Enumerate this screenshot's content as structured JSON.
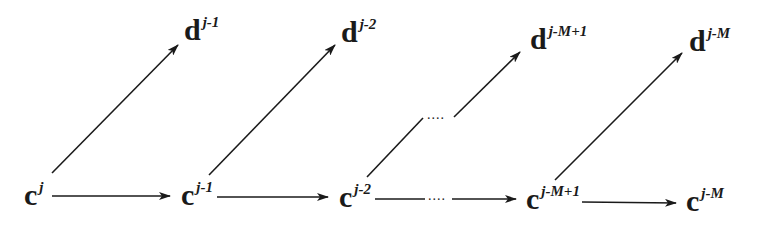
{
  "diagram": {
    "type": "wavelet-decomposition-tree",
    "c_nodes": [
      {
        "base": "c",
        "sup": "j"
      },
      {
        "base": "c",
        "sup": "j-1"
      },
      {
        "base": "c",
        "sup": "j-2"
      },
      {
        "base": "c",
        "sup": "j-M+1"
      },
      {
        "base": "c",
        "sup": "j-M"
      }
    ],
    "d_nodes": [
      {
        "base": "d",
        "sup": "j-1"
      },
      {
        "base": "d",
        "sup": "j-2"
      },
      {
        "base": "d",
        "sup": "j-M+1"
      },
      {
        "base": "d",
        "sup": "j-M"
      }
    ],
    "ellipsis_horizontal": "....",
    "ellipsis_diagonal": "....",
    "colors": {
      "stroke": "#1a1a1a",
      "background": "#ffffff"
    }
  }
}
